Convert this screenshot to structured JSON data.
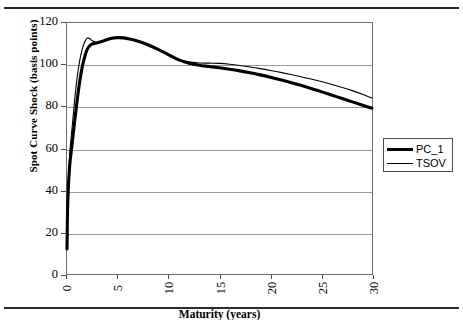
{
  "figure": {
    "background": "#ffffff",
    "frame_color": "#6e6e6e",
    "grid_color": "#9a9a9a",
    "rule_color": "#2b2b2b"
  },
  "legend": {
    "position": "right",
    "entries": [
      {
        "label": "PC_1",
        "style": "thick",
        "color": "#000000"
      },
      {
        "label": "TSOV",
        "style": "thin",
        "color": "#000000"
      }
    ]
  },
  "chart_data": {
    "type": "line",
    "title": "",
    "subtitle": "",
    "xlabel": "Maturity (years)",
    "ylabel": "Spot Curve Shock (basis points)",
    "xlim": [
      0,
      30
    ],
    "ylim": [
      0,
      120
    ],
    "xticks": [
      0,
      5,
      10,
      15,
      20,
      25,
      30
    ],
    "xtick_labels": [
      "0",
      "5",
      "10",
      "15",
      "20",
      "25",
      "30"
    ],
    "yticks": [
      0,
      20,
      40,
      60,
      80,
      100,
      120
    ],
    "ytick_labels": [
      "0",
      "20",
      "40",
      "60",
      "80",
      "100",
      "120"
    ],
    "grid": "horizontal",
    "legend_position": "right-outside",
    "x": [
      0,
      0.08,
      0.25,
      0.5,
      0.75,
      1,
      1.25,
      1.5,
      1.75,
      2,
      2.25,
      2.5,
      3,
      3.5,
      4,
      4.5,
      5,
      5.5,
      6,
      7,
      8,
      9,
      10,
      11,
      12,
      13,
      14,
      15,
      16,
      17,
      18,
      19,
      20,
      21,
      22,
      23,
      24,
      25,
      26,
      27,
      28,
      29,
      30
    ],
    "series": [
      {
        "name": "PC_1",
        "style": "thick",
        "color": "#000000",
        "values": [
          12,
          35,
          51,
          62,
          73,
          83,
          92,
          99,
          104,
          107.5,
          109.2,
          110.0,
          110.5,
          111.3,
          112.2,
          112.8,
          113.0,
          112.9,
          112.5,
          111.3,
          109.5,
          107.3,
          104.8,
          102.4,
          100.8,
          99.8,
          99.2,
          98.6,
          97.9,
          97.1,
          96.2,
          95.2,
          94.1,
          92.9,
          91.6,
          90.2,
          88.7,
          87.2,
          85.6,
          84.0,
          82.4,
          80.8,
          79.2
        ]
      },
      {
        "name": "TSOV",
        "style": "thin",
        "color": "#000000",
        "values": [
          12,
          38,
          56,
          70,
          83,
          94,
          102,
          107.5,
          111,
          112.8,
          112.5,
          111.5,
          110.6,
          111.0,
          111.8,
          112.5,
          112.9,
          112.8,
          112.4,
          111.2,
          109.4,
          107.2,
          104.8,
          102.6,
          101.4,
          100.9,
          100.8,
          100.7,
          100.3,
          99.7,
          99.0,
          98.2,
          97.3,
          96.4,
          95.4,
          94.3,
          93.2,
          92.0,
          90.7,
          89.3,
          87.8,
          86.1,
          84.1
        ]
      }
    ],
    "annotations": []
  }
}
